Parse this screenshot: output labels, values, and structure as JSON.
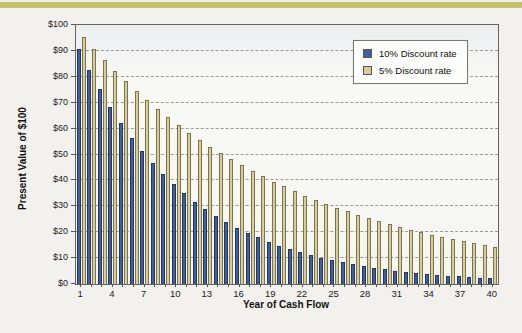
{
  "page": {
    "background": "#f2f1ed",
    "accent_band_color": "#c7c06b"
  },
  "chart_data": {
    "type": "bar",
    "title": "",
    "xlabel": "Year of Cash Flow",
    "ylabel": "Present Value of $100",
    "x": [
      1,
      2,
      3,
      4,
      5,
      6,
      7,
      8,
      9,
      10,
      11,
      12,
      13,
      14,
      15,
      16,
      17,
      18,
      19,
      20,
      21,
      22,
      23,
      24,
      25,
      26,
      27,
      28,
      29,
      30,
      31,
      32,
      33,
      34,
      35,
      36,
      37,
      38,
      39,
      40
    ],
    "x_tick_labels": [
      "1",
      "4",
      "7",
      "10",
      "13",
      "16",
      "19",
      "22",
      "25",
      "28",
      "31",
      "34",
      "37",
      "40"
    ],
    "y_tick_values": [
      0,
      10,
      20,
      30,
      40,
      50,
      60,
      70,
      80,
      90,
      100
    ],
    "y_tick_labels": [
      "$0",
      "$10",
      "$20",
      "$30",
      "$40",
      "$50",
      "$60",
      "$70",
      "$80",
      "$90",
      "$100"
    ],
    "ylim": [
      0,
      100
    ],
    "grid": "horizontal-dashed",
    "gridline_color": "#9b9b96",
    "legend_position": "top-right-inside",
    "series": [
      {
        "name": "10% Discount rate",
        "color": "#42609f",
        "border": "#24365f",
        "values": [
          90.91,
          82.64,
          75.13,
          68.3,
          62.09,
          56.45,
          51.32,
          46.65,
          42.41,
          38.55,
          35.05,
          31.86,
          28.97,
          26.33,
          23.94,
          21.76,
          19.78,
          17.99,
          16.35,
          14.86,
          13.51,
          12.28,
          11.17,
          10.15,
          9.23,
          8.39,
          7.63,
          6.93,
          6.3,
          5.73,
          5.21,
          4.74,
          4.31,
          3.91,
          3.56,
          3.23,
          2.94,
          2.67,
          2.43,
          2.21
        ]
      },
      {
        "name": "5% Discount rate",
        "color": "#d8cc97",
        "border": "#7a744f",
        "values": [
          95.24,
          90.7,
          86.38,
          82.27,
          78.35,
          74.62,
          71.07,
          67.68,
          64.46,
          61.39,
          58.47,
          55.68,
          53.03,
          50.51,
          48.1,
          45.81,
          43.63,
          41.55,
          39.57,
          37.69,
          35.89,
          34.18,
          32.56,
          31.01,
          29.53,
          28.12,
          26.78,
          25.51,
          24.29,
          23.14,
          22.04,
          20.99,
          19.99,
          19.04,
          18.13,
          17.27,
          16.44,
          15.66,
          14.91,
          14.2
        ]
      }
    ]
  }
}
